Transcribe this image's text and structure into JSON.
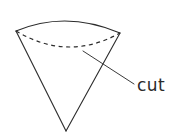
{
  "figure": {
    "kind": "hand-drawn-geometry-sketch",
    "background_color": "#ffffff",
    "ink_color": "#2b2b2b",
    "width": 179,
    "height": 140
  },
  "annotations": {
    "cut_label": {
      "text": "cut",
      "x": 137,
      "y": 91
    }
  },
  "geometry": {
    "left_vertex": {
      "x": 16,
      "y": 31
    },
    "right_vertex": {
      "x": 120,
      "y": 33
    },
    "apex": {
      "x": 66,
      "y": 131
    },
    "top_arc_peak": {
      "x": 66,
      "y": 16
    },
    "dashed_arc_low": {
      "x": 68,
      "y": 50
    },
    "leader_start": {
      "x": 83,
      "y": 51
    },
    "leader_end": {
      "x": 134,
      "y": 84
    },
    "top_arc_path": "M 16 31 Q 66 10 120 33",
    "dashed_arc_path": "M 16 31 Q 68 62 120 33",
    "left_edge_path": "M 16 31 L 66 131",
    "right_edge_path": "M 120 33 L 66 131",
    "leader_path": "M 83 51 L 134 84"
  }
}
